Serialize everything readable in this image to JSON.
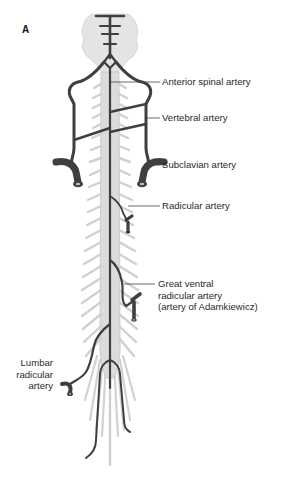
{
  "figure": {
    "panel_label": "A",
    "colors": {
      "artery": "#3f3f3f",
      "cord": "#dcdcdc",
      "cord_edge": "#c4c4c4",
      "nerve_roots": "#d6d6d6",
      "brainstem": "#e4e4e4",
      "label_text": "#2a2a2a",
      "leader_line": "#444444",
      "background": "#ffffff"
    }
  },
  "labels": {
    "anterior_spinal": "Anterior spinal artery",
    "vertebral": "Vertebral artery",
    "subclavian": "Subclavian artery",
    "radicular": "Radicular artery",
    "great_ventral_1": "Great ventral",
    "great_ventral_2": "radicular artery",
    "great_ventral_3": "(artery of Adamkiewicz)",
    "lumbar_1": "Lumbar",
    "lumbar_2": "radicular",
    "lumbar_3": "artery"
  }
}
